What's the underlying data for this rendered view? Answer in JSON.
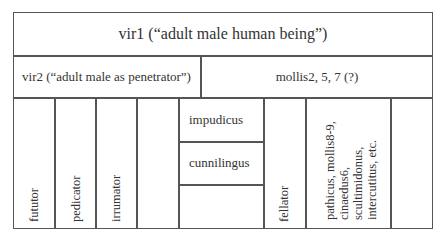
{
  "diagram": {
    "row1": {
      "label": "vir1 (“adult male human being”)"
    },
    "row2": {
      "left": "vir2 (“adult male as penetrator”)",
      "right": "mollis2, 5, 7 (?)"
    },
    "row3": {
      "columns": [
        {
          "label": "fututor"
        },
        {
          "label": "pedicator"
        },
        {
          "label": "irrumator"
        },
        {
          "label": ""
        },
        {
          "stacked": [
            "impudicus",
            "cunnilingus",
            ""
          ]
        },
        {
          "label": "fellator"
        },
        {
          "lines": [
            "pathicus, mollis8-9,",
            "cinaedus6,",
            "scultimidonus,",
            "intercutitus, etc."
          ]
        },
        {
          "label": ""
        }
      ]
    }
  }
}
